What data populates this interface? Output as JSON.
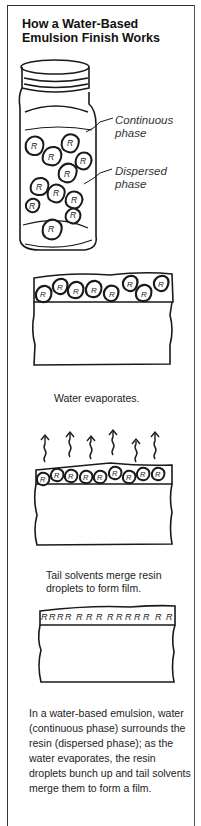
{
  "figure": {
    "title": "How a Water-Based Emulsion Finish Works",
    "jar": {
      "continuous_label": "Continuous phase",
      "dispersed_label": "Dispersed phase",
      "resin_glyph": "R"
    },
    "steps": [
      {
        "caption": ""
      },
      {
        "caption": "Water evaporates."
      },
      {
        "caption": "Tail solvents merge resin droplets to form film."
      }
    ],
    "description": "In a water-based emulsion, water (continuous phase) surrounds the resin (dispersed phase); as the water evaporates, the resin droplets bunch up and tail solvents merge them to form a film."
  },
  "colors": {
    "ink": "#1a1a1a",
    "background": "#ffffff"
  }
}
